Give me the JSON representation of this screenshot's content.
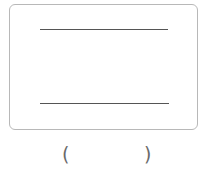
{
  "figure": {
    "box": {
      "border_color": "#b8b8b8"
    },
    "lines": [
      {
        "label": "top-line",
        "x1": 40,
        "x2": 168,
        "y": 29,
        "color": "#555555"
      },
      {
        "label": "bottom-line",
        "x1": 40,
        "x2": 169,
        "y": 103,
        "color": "#555555"
      }
    ],
    "answer": {
      "open_paren": "(",
      "close_paren": ")",
      "value": ""
    }
  }
}
